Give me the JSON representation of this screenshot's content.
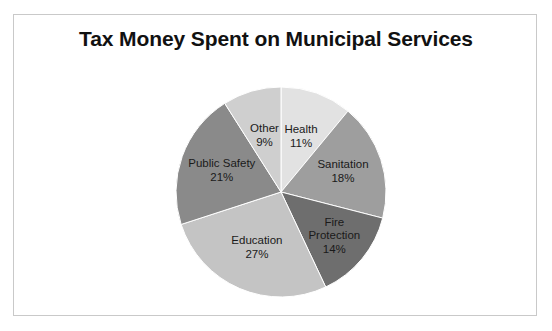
{
  "figure": {
    "title": "Tax Money Spent on Municipal Services",
    "background_color": "#ffffff",
    "border_color": "#c9c9c9"
  },
  "chart_data": {
    "type": "pie",
    "title": "Tax Money Spent on Municipal Services",
    "xlabel": "",
    "ylabel": "",
    "start_angle_deg": 0,
    "direction": "clockwise",
    "legend": "none",
    "grid": false,
    "units": "percent",
    "total": 100,
    "categories": [
      "Health",
      "Sanitation",
      "Fire Protection",
      "Education",
      "Public Safety",
      "Other"
    ],
    "values": [
      11,
      18,
      14,
      27,
      21,
      9
    ],
    "colors": [
      "#e2e2e2",
      "#9e9e9e",
      "#6e6e6e",
      "#c4c4c4",
      "#8a8a8a",
      "#cfcfcf"
    ],
    "slices": [
      {
        "name": "Health",
        "value": 11,
        "label": "Health",
        "pct_label": "11%",
        "color": "#e2e2e2"
      },
      {
        "name": "Sanitation",
        "value": 18,
        "label": "Sanitation",
        "pct_label": "18%",
        "color": "#9e9e9e"
      },
      {
        "name": "Fire Protection",
        "value": 14,
        "label": "Fire\nProtection",
        "pct_label": "14%",
        "color": "#6e6e6e"
      },
      {
        "name": "Education",
        "value": 27,
        "label": "Education",
        "pct_label": "27%",
        "color": "#c4c4c4"
      },
      {
        "name": "Public Safety",
        "value": 21,
        "label": "Public Safety",
        "pct_label": "21%",
        "color": "#8a8a8a"
      },
      {
        "name": "Other",
        "value": 9,
        "label": "Other",
        "pct_label": "9%",
        "color": "#cfcfcf"
      }
    ]
  }
}
